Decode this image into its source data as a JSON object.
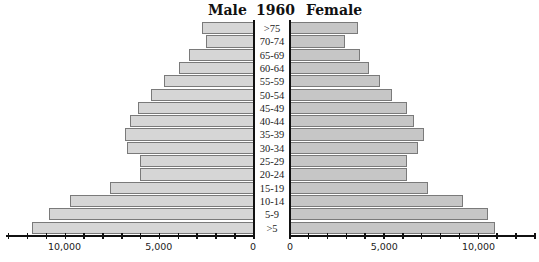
{
  "chart_data": {
    "type": "bar",
    "orientation": "horizontal",
    "subtype": "population-pyramid",
    "title": "1960",
    "left_title": "Male",
    "right_title": "Female",
    "categories": [
      ">75",
      "70-74",
      "65-69",
      "60-64",
      "55-59",
      "50-54",
      "45-49",
      "40-44",
      "35-39",
      "30-34",
      "25-29",
      "20-24",
      "15-19",
      "10-14",
      "5-9",
      ">5"
    ],
    "series": [
      {
        "name": "Male",
        "side": "left",
        "color": "#d6d6d6",
        "values": [
          2700,
          2500,
          3400,
          3900,
          4700,
          5400,
          6100,
          6500,
          6800,
          6700,
          6000,
          6000,
          7600,
          9700,
          10800,
          11700
        ]
      },
      {
        "name": "Female",
        "side": "right",
        "color": "#c6c6c6",
        "values": [
          3600,
          2900,
          3700,
          4200,
          4800,
          5400,
          6200,
          6600,
          7100,
          6800,
          6200,
          6200,
          7300,
          9200,
          10500,
          10900
        ]
      }
    ],
    "xlim": [
      0,
      13000
    ],
    "x_tick_labels_left": [
      "10,000",
      "5,000",
      "0"
    ],
    "x_tick_labels_right": [
      "0",
      "5,000",
      "10,000"
    ],
    "minor_tick_step": 1000,
    "xlabel": "",
    "ylabel": "",
    "grid": false,
    "legend": "none"
  }
}
